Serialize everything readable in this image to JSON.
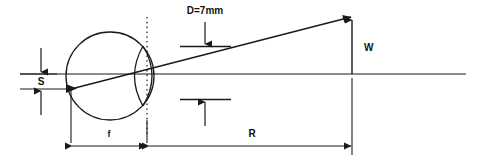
{
  "diagram": {
    "type": "technical-line-diagram",
    "background_color": "#ffffff",
    "line_color": "#1a1a1a",
    "labels": {
      "aperture": "D=7mm",
      "spot_offset": "S",
      "image_height": "W",
      "focal_length": "f",
      "projection_distance": "R"
    },
    "elements": {
      "optical_axis": "horizontal-axis-line",
      "eyeball": "circle-outline",
      "cornea": "lens-arc",
      "principal_plane": "dotted-vertical-line",
      "ray": "diagonal-ray-line",
      "aperture_arrows": "inward-dimension-arrows",
      "height_arrow": "vertical-arrow-up",
      "focal_dimension": "double-headed-arrow",
      "range_dimension": "double-headed-arrow"
    }
  }
}
